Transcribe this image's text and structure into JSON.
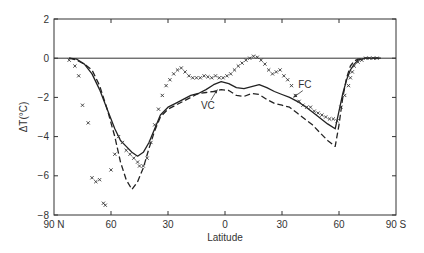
{
  "chart_data": {
    "type": "line",
    "title": "",
    "xlabel": "Latitude",
    "ylabel": "ΔT(°C)",
    "xlim": [
      90,
      -90
    ],
    "ylim": [
      -8,
      2
    ],
    "grid": false,
    "legend": "none (curves labeled inline)",
    "x_ticks": [
      {
        "value": 90,
        "label": "90 N"
      },
      {
        "value": 60,
        "label": "60"
      },
      {
        "value": 30,
        "label": "30"
      },
      {
        "value": 0,
        "label": "0"
      },
      {
        "value": -30,
        "label": "30"
      },
      {
        "value": -60,
        "label": "60"
      },
      {
        "value": -90,
        "label": "90 S"
      }
    ],
    "y_ticks": [
      {
        "value": 2,
        "label": "2"
      },
      {
        "value": 0,
        "label": "0"
      },
      {
        "value": -2,
        "label": "−2"
      },
      {
        "value": -4,
        "label": "−4"
      },
      {
        "value": -6,
        "label": "−6"
      },
      {
        "value": -8,
        "label": "−8"
      }
    ],
    "reference_line": {
      "y": 0
    },
    "annotations": [
      {
        "text": "FC",
        "x": -42,
        "y": -1.5,
        "arrow_to": [
          -36,
          -2.0
        ]
      },
      {
        "text": "VC",
        "x": 9,
        "y": -2.6,
        "arrow_to": [
          4,
          -1.6
        ]
      }
    ],
    "series": [
      {
        "name": "FC",
        "style": "solid",
        "x": [
          82,
          78,
          74,
          70,
          66,
          62,
          58,
          55,
          52,
          49,
          46,
          43,
          40,
          37,
          34,
          30,
          26,
          22,
          18,
          14,
          10,
          6,
          2,
          -2,
          -6,
          -10,
          -14,
          -18,
          -22,
          -26,
          -30,
          -34,
          -38,
          -42,
          -46,
          -50,
          -54,
          -58,
          -60,
          -62,
          -64,
          -66,
          -68,
          -70,
          -74,
          -78,
          -82
        ],
        "values": [
          0,
          -0.05,
          -0.3,
          -0.8,
          -1.6,
          -2.6,
          -3.6,
          -4.2,
          -4.5,
          -4.8,
          -5.0,
          -4.8,
          -4.3,
          -3.6,
          -2.9,
          -2.5,
          -2.3,
          -2.1,
          -1.9,
          -1.8,
          -1.6,
          -1.35,
          -1.2,
          -1.3,
          -1.5,
          -1.55,
          -1.45,
          -1.35,
          -1.5,
          -1.7,
          -1.85,
          -2.0,
          -2.2,
          -2.45,
          -2.75,
          -3.05,
          -3.35,
          -3.6,
          -2.7,
          -1.8,
          -1.1,
          -0.6,
          -0.3,
          -0.1,
          0,
          0,
          0
        ]
      },
      {
        "name": "VC",
        "style": "dashed",
        "x": [
          82,
          78,
          74,
          70,
          66,
          62,
          58,
          55,
          52,
          49,
          46,
          43,
          40,
          37,
          34,
          30,
          26,
          22,
          18,
          14,
          10,
          6,
          2,
          -2,
          -6,
          -10,
          -14,
          -18,
          -22,
          -26,
          -30,
          -34,
          -38,
          -42,
          -46,
          -50,
          -54,
          -58,
          -60,
          -62,
          -64,
          -66,
          -68,
          -70,
          -74,
          -78,
          -82
        ],
        "values": [
          0,
          -0.1,
          -0.3,
          -0.6,
          -1.4,
          -2.6,
          -4.0,
          -5.3,
          -6.2,
          -6.7,
          -6.3,
          -5.6,
          -4.6,
          -3.7,
          -3.0,
          -2.6,
          -2.4,
          -2.2,
          -2.0,
          -1.8,
          -1.75,
          -1.7,
          -1.6,
          -1.65,
          -1.9,
          -1.95,
          -1.8,
          -1.85,
          -2.1,
          -2.3,
          -2.4,
          -2.5,
          -2.8,
          -3.1,
          -3.4,
          -3.8,
          -4.2,
          -4.5,
          -3.4,
          -2.0,
          -1.0,
          -0.4,
          -0.15,
          -0.05,
          0,
          0,
          0
        ]
      },
      {
        "name": "Observed",
        "style": "markers-x",
        "x": [
          82,
          79,
          77,
          75,
          72,
          70,
          68,
          66,
          64,
          63,
          60,
          58,
          56,
          54,
          52,
          50,
          48,
          46,
          45,
          43,
          41,
          39,
          37,
          35,
          33,
          31,
          29,
          27,
          25,
          23,
          21,
          19,
          17,
          15,
          13,
          11,
          9,
          7,
          5,
          3,
          1,
          -1,
          -3,
          -5,
          -7,
          -9,
          -11,
          -13,
          -15,
          -17,
          -19,
          -21,
          -23,
          -25,
          -27,
          -29,
          -31,
          -33,
          -35,
          -37,
          -39,
          -41,
          -43,
          -45,
          -47,
          -49,
          -51,
          -53,
          -55,
          -57,
          -59,
          -61,
          -63,
          -65,
          -66,
          -67,
          -68,
          -70,
          -72,
          -74,
          -76,
          -78,
          -80
        ],
        "values": [
          -0.1,
          -0.4,
          -0.9,
          -2.4,
          -3.3,
          -6.1,
          -6.3,
          -6.2,
          -7.4,
          -7.5,
          -5.7,
          -4.9,
          -4.0,
          -4.3,
          -4.7,
          -4.9,
          -5.1,
          -5.3,
          -5.5,
          -5.5,
          -5.1,
          -4.3,
          -3.4,
          -2.6,
          -1.9,
          -1.4,
          -1.1,
          -0.8,
          -0.6,
          -0.5,
          -0.7,
          -0.9,
          -1.0,
          -1.0,
          -1.0,
          -0.9,
          -0.95,
          -1.0,
          -0.9,
          -1.0,
          -1.0,
          -0.9,
          -0.8,
          -0.6,
          -0.4,
          -0.25,
          -0.1,
          0.0,
          0.1,
          0.05,
          -0.1,
          -0.3,
          -0.6,
          -0.8,
          -0.7,
          -0.6,
          -0.9,
          -1.1,
          -1.4,
          -1.9,
          -2.2,
          -2.4,
          -2.5,
          -2.5,
          -2.7,
          -2.8,
          -2.9,
          -3.0,
          -3.1,
          -3.1,
          -3.2,
          -2.5,
          -1.9,
          -1.4,
          -1.0,
          -0.7,
          -0.4,
          -0.2,
          -0.1,
          0.0,
          0.0,
          0.0,
          0.0
        ]
      }
    ]
  }
}
